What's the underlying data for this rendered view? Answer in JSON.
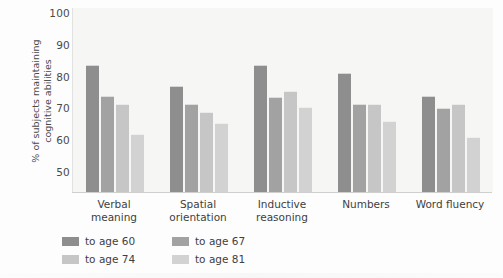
{
  "chart_data": {
    "type": "bar",
    "title": "",
    "xlabel": "",
    "ylabel": "% of subjects maintaining\ncognitive abilities",
    "ylim": [
      50,
      100
    ],
    "yticks": [
      50,
      60,
      70,
      80,
      90,
      100
    ],
    "ytick_labels": [
      "50",
      "60",
      "70",
      "80",
      "90",
      "100"
    ],
    "grid": false,
    "legend_position": "bottom-left",
    "categories": [
      "Verbal meaning",
      "Spatial orientation",
      "Inductive reasoning",
      "Numbers",
      "Word fluency"
    ],
    "category_lines": [
      [
        "Verbal",
        "meaning"
      ],
      [
        "Spatial",
        "orientation"
      ],
      [
        "Inductive",
        "reasoning"
      ],
      [
        "Numbers",
        ""
      ],
      [
        "Word fluency",
        ""
      ]
    ],
    "series": [
      {
        "name": "to age 60",
        "color": "#8e8e8e",
        "values": [
          83.5,
          77.0,
          83.5,
          81.0,
          74.0
        ]
      },
      {
        "name": "to age 67",
        "color": "#a2a2a2",
        "values": [
          74.0,
          71.5,
          73.5,
          71.5,
          70.0
        ]
      },
      {
        "name": "to age 74",
        "color": "#c6c6c6",
        "values": [
          71.5,
          69.0,
          75.5,
          71.5,
          71.5
        ]
      },
      {
        "name": "to age 81",
        "color": "#d2d2d2",
        "values": [
          62.0,
          65.5,
          70.5,
          66.0,
          61.0
        ]
      }
    ]
  },
  "ylabel_line1": "% of subjects maintaining",
  "ylabel_line2": "cognitive abilities"
}
